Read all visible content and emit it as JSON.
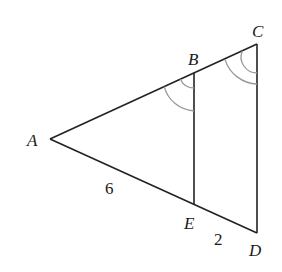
{
  "diagram": {
    "type": "geometry-similar-triangles",
    "points": {
      "A": {
        "label": "A",
        "x": 50,
        "y": 139
      },
      "B": {
        "label": "B",
        "x": 194,
        "y": 73
      },
      "C": {
        "label": "C",
        "x": 257,
        "y": 44
      },
      "D": {
        "label": "D",
        "x": 257,
        "y": 233
      },
      "E": {
        "label": "E",
        "x": 194,
        "y": 205
      }
    },
    "segments": [
      "AC",
      "AD",
      "BE",
      "CD"
    ],
    "measures": {
      "AE": "6",
      "ED": "2"
    },
    "angle_marks": [
      {
        "at": "B",
        "between": [
          "A",
          "E"
        ],
        "arcs": 2
      },
      {
        "at": "C",
        "between": [
          "A",
          "D"
        ],
        "arcs": 2
      }
    ]
  }
}
